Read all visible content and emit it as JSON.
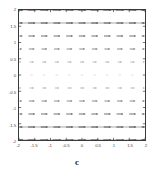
{
  "figure": {
    "background_color": "#ffffff",
    "frame_color": "#3a3a3a",
    "ink_color": "#555555"
  },
  "axes": {
    "x_title": "c",
    "y_title": "",
    "x_tick_labels": [
      "-2",
      "-1.5",
      "-1",
      "-0.5",
      "0",
      "0.5",
      "1",
      "1.5",
      "2"
    ],
    "y_tick_labels": [
      "2",
      "1.5",
      "1",
      "0.5",
      "0",
      "-0.5",
      "-1",
      "-1.5",
      "-2"
    ]
  },
  "chart_data": {
    "type": "scatter",
    "title": "",
    "subtitle": "",
    "xlabel": "c",
    "ylabel": "",
    "xlim": [
      -2,
      2
    ],
    "ylim": [
      -2,
      2
    ],
    "xticks": [
      -2,
      -1.5,
      -1,
      -0.5,
      0,
      0.5,
      1,
      1.5,
      2
    ],
    "yticks": [
      -2,
      -1.5,
      -1,
      -0.5,
      0,
      0.5,
      1,
      1.5,
      2
    ],
    "xticklabels": [
      "-2",
      "-1.5",
      "-1",
      "-0.5",
      "0",
      "0.5",
      "1",
      "1.5",
      "2"
    ],
    "yticklabels": [
      "-2",
      "-1.5",
      "-1",
      "-0.5",
      "0",
      "0.5",
      "1",
      "1.5",
      "2"
    ],
    "grid": false,
    "legend": null,
    "plot_style": "direction_field_horizontal_dashes",
    "x_grid_values": [
      -2,
      -1.6,
      -1.2,
      -0.8,
      -0.4,
      0,
      0.4,
      0.8,
      1.2,
      1.6,
      2
    ],
    "y_grid_values": [
      2,
      1.6,
      1.2,
      0.8,
      0.4,
      0,
      -0.4,
      -0.8,
      -1.2,
      -1.6,
      -2
    ],
    "rows": [
      {
        "y": 2,
        "solid_line": true,
        "intensity": 0.95,
        "dash_width": 8.0,
        "direction": "right"
      },
      {
        "y": 1.6,
        "solid_line": true,
        "intensity": 0.85,
        "dash_width": 7.0,
        "direction": "right"
      },
      {
        "y": 1.2,
        "solid_line": false,
        "intensity": 0.72,
        "dash_width": 6.6,
        "direction": "right"
      },
      {
        "y": 0.8,
        "solid_line": false,
        "intensity": 0.58,
        "dash_width": 5.6,
        "direction": "right"
      },
      {
        "y": 0.4,
        "solid_line": false,
        "intensity": 0.34,
        "dash_width": 4.2,
        "direction": "right"
      },
      {
        "y": 0,
        "solid_line": false,
        "intensity": 0.16,
        "dash_width": 2.6,
        "direction": "right"
      },
      {
        "y": -0.4,
        "solid_line": false,
        "intensity": 0.34,
        "dash_width": 4.2,
        "direction": "right"
      },
      {
        "y": -0.8,
        "solid_line": false,
        "intensity": 0.58,
        "dash_width": 5.6,
        "direction": "right"
      },
      {
        "y": -1.2,
        "solid_line": false,
        "intensity": 0.72,
        "dash_width": 6.6,
        "direction": "right"
      },
      {
        "y": -1.6,
        "solid_line": true,
        "intensity": 0.85,
        "dash_width": 7.0,
        "direction": "right"
      },
      {
        "y": -2,
        "solid_line": true,
        "intensity": 0.95,
        "dash_width": 8.0,
        "direction": "right"
      }
    ]
  }
}
